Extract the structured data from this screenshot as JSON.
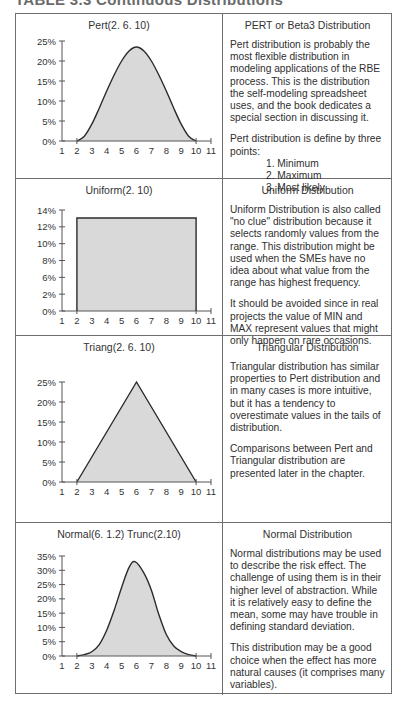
{
  "caption": "TABLE 3.3 Continuous Distributions",
  "rows": [
    {
      "chart_title": "Pert(2. 6. 10)",
      "title": "PERT or Beta3 Distribution",
      "paragraphs": [
        "Pert distribution is probably the most flexible distribution in modeling applications of the RBE process. This is the distribution the self-modeling spreadsheet uses, and the book dedicates a special section in discussing it.",
        "Pert distribution is define by three points:"
      ],
      "list": [
        "1. Minimum",
        "2. Maximum",
        "3. Most likely"
      ]
    },
    {
      "chart_title": "Uniform(2. 10)",
      "title": "Uniform Distribution",
      "paragraphs": [
        "Uniform Distribution is also called \"no clue\" distribution because it selects randomly values from the range. This distribution might be used when the SMEs have no idea about what value from the range has highest frequency.",
        "It should be avoided since in real projects the value of MIN and MAX represent values that might only happen on rare occasions."
      ]
    },
    {
      "chart_title": "Triang(2. 6. 10)",
      "title": "Triangular Distribution",
      "paragraphs": [
        "Triangular distribution has similar properties to Pert distribution and in many cases is more intuitive, but it has a tendency to overestimate values in the tails of distribution.",
        "Comparisons between Pert and Triangular distribution are presented later in the chapter."
      ]
    },
    {
      "chart_title": "Normal(6. 1.2) Trunc(2.10)",
      "title": "Normal Distribution",
      "paragraphs": [
        "Normal distributions may be used to describe the risk effect. The challenge of using them is in their higher level of abstraction. While it is relatively easy to define the mean, some may have trouble in defining standard deviation.",
        "This distribution may be a good choice when the effect has more natural causes (it comprises many variables)."
      ]
    }
  ],
  "colors": {
    "fill": "#d9d9d9",
    "line": "#2b2b2b",
    "border": "#6e6e6e"
  },
  "chart_data": [
    {
      "type": "area",
      "title": "Pert(2. 6. 10)",
      "xlabel": "",
      "ylabel": "",
      "x_ticks": [
        1,
        2,
        3,
        4,
        5,
        6,
        7,
        8,
        9,
        10,
        11
      ],
      "y_ticks": [
        "0%",
        "5%",
        "10%",
        "15%",
        "20%",
        "25%"
      ],
      "xlim": [
        1,
        11
      ],
      "ylim": [
        0,
        25
      ],
      "x": [
        2,
        2.5,
        3,
        3.5,
        4,
        4.5,
        5,
        5.5,
        6,
        6.5,
        7,
        7.5,
        8,
        8.5,
        9,
        9.5,
        10
      ],
      "values": [
        0,
        1.2,
        4.2,
        8.2,
        12.5,
        16.5,
        20,
        22.5,
        23.5,
        22.5,
        20,
        16.5,
        12.5,
        8.2,
        4.2,
        1.2,
        0
      ],
      "grid": false
    },
    {
      "type": "area",
      "title": "Uniform(2. 10)",
      "xlabel": "",
      "ylabel": "",
      "x_ticks": [
        1,
        2,
        3,
        4,
        5,
        6,
        7,
        8,
        9,
        10,
        11
      ],
      "y_ticks": [
        "0%",
        "2%",
        "6%",
        "8%",
        "10%",
        "12%",
        "14%"
      ],
      "xlim": [
        1,
        11
      ],
      "ylim": [
        0,
        14
      ],
      "x": [
        2,
        2,
        10,
        10
      ],
      "values": [
        0,
        12.9,
        12.9,
        0
      ],
      "grid": false
    },
    {
      "type": "area",
      "title": "Triang(2. 6. 10)",
      "xlabel": "",
      "ylabel": "",
      "x_ticks": [
        1,
        2,
        3,
        4,
        5,
        6,
        7,
        8,
        9,
        10,
        11
      ],
      "y_ticks": [
        "0%",
        "5%",
        "10%",
        "15%",
        "20%",
        "25%"
      ],
      "xlim": [
        1,
        11
      ],
      "ylim": [
        0,
        25
      ],
      "x": [
        2,
        6,
        10
      ],
      "values": [
        0,
        25,
        0
      ],
      "grid": false
    },
    {
      "type": "area",
      "title": "Normal(6. 1.2) Trunc(2.10)",
      "xlabel": "",
      "ylabel": "",
      "x_ticks": [
        1,
        2,
        3,
        4,
        5,
        6,
        7,
        8,
        9,
        10,
        11
      ],
      "y_ticks": [
        "0%",
        "5%",
        "10%",
        "15%",
        "20%",
        "25%",
        "30%",
        "35%"
      ],
      "xlim": [
        1,
        11
      ],
      "ylim": [
        0,
        35
      ],
      "x": [
        2,
        2.5,
        3,
        3.5,
        4,
        4.5,
        5,
        5.5,
        5.9,
        6.5,
        7,
        7.5,
        8,
        8.5,
        9,
        9.5,
        10
      ],
      "values": [
        0,
        0.5,
        1.5,
        4,
        9,
        16,
        24,
        31,
        33,
        29,
        23,
        14.5,
        7.5,
        3.5,
        1.5,
        0.5,
        0
      ],
      "grid": false
    }
  ]
}
